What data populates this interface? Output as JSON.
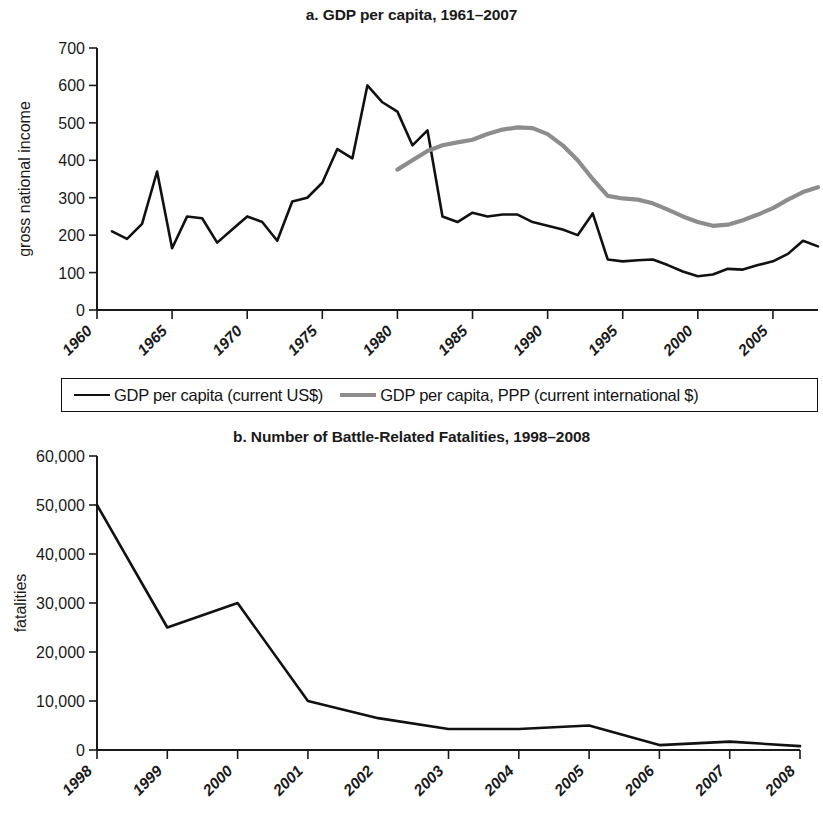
{
  "figure": {
    "panel_a_title": "a. GDP per capita, 1961–2007",
    "panel_b_title": "b. Number of Battle-Related Fatalities, 1998–2008"
  },
  "legend": {
    "series_1_label": "GDP per capita (current US$)",
    "series_2_label": "GDP per capita, PPP (current international $)",
    "series_1_color": "#111111",
    "series_2_color": "#8d8d8d"
  },
  "panel_a": {
    "ylabel": "gross national income",
    "y_ticks": [
      "0",
      "100",
      "200",
      "300",
      "400",
      "500",
      "600",
      "700"
    ],
    "x_ticks": [
      "1960",
      "1965",
      "1970",
      "1975",
      "1980",
      "1985",
      "1990",
      "1995",
      "2000",
      "2005"
    ]
  },
  "panel_b": {
    "ylabel": "fatalities",
    "y_ticks": [
      "0",
      "10,000",
      "20,000",
      "30,000",
      "40,000",
      "50,000",
      "60,000"
    ],
    "x_ticks": [
      "1998",
      "1999",
      "2000",
      "2001",
      "2002",
      "2003",
      "2004",
      "2005",
      "2006",
      "2007",
      "2008"
    ]
  },
  "chart_data": [
    {
      "type": "line",
      "title": "a. GDP per capita, 1961–2007",
      "xlabel": "",
      "ylabel": "gross national income",
      "xlim": [
        1960,
        2008
      ],
      "ylim": [
        0,
        700
      ],
      "grid": false,
      "legend_position": "below",
      "x_tick_values": [
        1960,
        1965,
        1970,
        1975,
        1980,
        1985,
        1990,
        1995,
        2000,
        2005
      ],
      "y_tick_values": [
        0,
        100,
        200,
        300,
        400,
        500,
        600,
        700
      ],
      "series": [
        {
          "name": "GDP per capita (current US$)",
          "color": "#111111",
          "x": [
            1961,
            1962,
            1963,
            1964,
            1965,
            1966,
            1967,
            1968,
            1969,
            1970,
            1971,
            1972,
            1973,
            1974,
            1975,
            1976,
            1977,
            1978,
            1979,
            1980,
            1981,
            1982,
            1983,
            1984,
            1985,
            1986,
            1987,
            1988,
            1989,
            1990,
            1991,
            1992,
            1993,
            1994,
            1995,
            1996,
            1997,
            1998,
            1999,
            2000,
            2001,
            2002,
            2003,
            2004,
            2005,
            2006,
            2007,
            2008
          ],
          "values": [
            210,
            190,
            230,
            370,
            165,
            250,
            245,
            180,
            215,
            250,
            235,
            185,
            290,
            300,
            340,
            430,
            405,
            600,
            555,
            530,
            440,
            480,
            250,
            235,
            260,
            250,
            255,
            255,
            235,
            225,
            215,
            200,
            258,
            135,
            130,
            133,
            135,
            120,
            103,
            90,
            95,
            110,
            108,
            120,
            130,
            150,
            185,
            170
          ]
        },
        {
          "name": "GDP per capita, PPP (current international $)",
          "color": "#8d8d8d",
          "x": [
            1980,
            1981,
            1982,
            1983,
            1984,
            1985,
            1986,
            1987,
            1988,
            1989,
            1990,
            1991,
            1992,
            1993,
            1994,
            1995,
            1996,
            1997,
            1998,
            1999,
            2000,
            2001,
            2002,
            2003,
            2004,
            2005,
            2006,
            2007,
            2008
          ],
          "values": [
            375,
            400,
            425,
            440,
            448,
            455,
            470,
            482,
            488,
            486,
            470,
            440,
            400,
            350,
            305,
            298,
            295,
            285,
            268,
            250,
            235,
            225,
            228,
            240,
            255,
            272,
            295,
            315,
            328
          ]
        }
      ]
    },
    {
      "type": "line",
      "title": "b. Number of Battle-Related Fatalities, 1998–2008",
      "xlabel": "",
      "ylabel": "fatalities",
      "xlim": [
        1998,
        2008
      ],
      "ylim": [
        0,
        60000
      ],
      "grid": false,
      "legend_position": "none",
      "x_tick_values": [
        1998,
        1999,
        2000,
        2001,
        2002,
        2003,
        2004,
        2005,
        2006,
        2007,
        2008
      ],
      "y_tick_values": [
        0,
        10000,
        20000,
        30000,
        40000,
        50000,
        60000
      ],
      "series": [
        {
          "name": "fatalities",
          "color": "#111111",
          "x": [
            1998,
            1999,
            2000,
            2001,
            2002,
            2003,
            2004,
            2005,
            2006,
            2007,
            2008
          ],
          "values": [
            50000,
            25000,
            30000,
            10000,
            6500,
            4300,
            4300,
            5000,
            1000,
            1700,
            800
          ]
        }
      ]
    }
  ]
}
